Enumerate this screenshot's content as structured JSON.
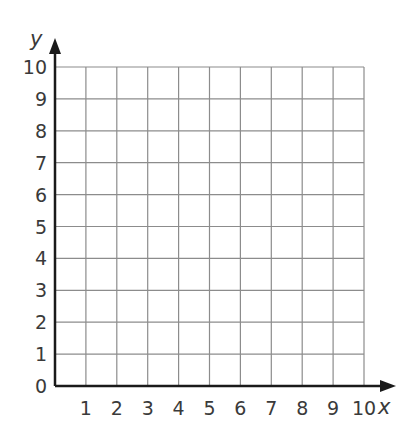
{
  "chart_data": {
    "type": "grid",
    "title": "",
    "xlabel": "x",
    "ylabel": "y",
    "xlim": [
      0,
      10
    ],
    "ylim": [
      0,
      10
    ],
    "x_ticks": [
      "1",
      "2",
      "3",
      "4",
      "5",
      "6",
      "7",
      "8",
      "9",
      "10"
    ],
    "y_ticks": [
      "0",
      "1",
      "2",
      "3",
      "4",
      "5",
      "6",
      "7",
      "8",
      "9",
      "10"
    ],
    "grid": true,
    "series": []
  },
  "colors": {
    "grid": "#8c8c8c",
    "axis": "#1a1a1a",
    "text": "#3a3a3a"
  }
}
